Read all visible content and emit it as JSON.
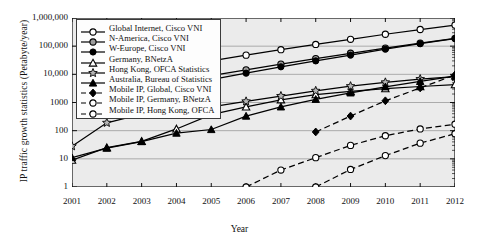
{
  "chart_data": {
    "type": "line",
    "title": "",
    "xlabel": "Year",
    "ylabel": "IP traffic growth statistics (Petabyte/year)",
    "x": [
      2001,
      2002,
      2003,
      2004,
      2005,
      2006,
      2007,
      2008,
      2009,
      2010,
      2011,
      2012
    ],
    "xtick_labels": [
      "2001",
      "2002",
      "2003",
      "2004",
      "2005",
      "2006",
      "2007",
      "2008",
      "2009",
      "2010",
      "2011",
      "2012"
    ],
    "ytick_labels": [
      "1,000,000",
      "100,000",
      "10,000",
      "1000",
      "100",
      "10",
      "1"
    ],
    "ytick_values": [
      1000000,
      100000,
      10000,
      1000,
      100,
      10,
      1
    ],
    "yscale": "log",
    "ylim": [
      1,
      1000000
    ],
    "xlim": [
      2001,
      2012
    ],
    "grid": "horizontal",
    "legend_position": "top-left inside",
    "plot_background": "#ebebeb",
    "series": [
      {
        "name": "Global Internet, Cisco VNI",
        "marker": "open-circle",
        "linestyle": "solid",
        "color": "#000000",
        "x": [
          2005,
          2006,
          2007,
          2008,
          2009,
          2010,
          2011,
          2012
        ],
        "values": [
          30000,
          48000,
          75000,
          115000,
          175000,
          265000,
          390000,
          560000
        ]
      },
      {
        "name": "N-America, Cisco VNI",
        "marker": "gray-circle",
        "linestyle": "solid",
        "color": "#000000",
        "x": [
          2005,
          2006,
          2007,
          2008,
          2009,
          2010,
          2011,
          2012
        ],
        "values": [
          9000,
          14500,
          23000,
          36000,
          56000,
          85000,
          128000,
          190000
        ]
      },
      {
        "name": "W-Europe, Cisco VNI",
        "marker": "filled-circle",
        "linestyle": "solid",
        "color": "#000000",
        "x": [
          2005,
          2006,
          2007,
          2008,
          2009,
          2010,
          2011,
          2012
        ],
        "values": [
          6500,
          11000,
          18500,
          30000,
          48000,
          78000,
          122000,
          185000
        ]
      },
      {
        "name": "Germany, BNetzA",
        "marker": "open-triangle",
        "linestyle": "solid",
        "color": "#000000",
        "x": [
          2001,
          2002,
          2003,
          2004,
          2005,
          2006,
          2007,
          2008,
          2009,
          2010,
          2011,
          2012
        ],
        "values": [
          9,
          25,
          42,
          115,
          370,
          700,
          1250,
          1900,
          2500,
          3100,
          3700,
          4300
        ]
      },
      {
        "name": "Hong Kong, OFCA Statistics",
        "marker": "gray-star",
        "linestyle": "solid",
        "color": "#000000",
        "x": [
          2001,
          2002,
          2003,
          2004,
          2005,
          2006,
          2007,
          2008,
          2009,
          2010,
          2011,
          2012
        ],
        "values": [
          28,
          190,
          390,
          480,
          700,
          1100,
          1700,
          2600,
          3800,
          5200,
          6800,
          8300
        ]
      },
      {
        "name": "Australia, Bureau of Statistics",
        "marker": "filled-triangle",
        "linestyle": "solid",
        "color": "#000000",
        "x": [
          2001,
          2002,
          2003,
          2004,
          2005,
          2006,
          2007,
          2008,
          2009,
          2010,
          2011,
          2012
        ],
        "values": [
          11,
          24,
          41,
          82,
          110,
          330,
          700,
          1300,
          2200,
          3600,
          5600,
          8600
        ]
      },
      {
        "name": "Mobile IP, Global, Cisco VNI",
        "marker": "filled-diamond",
        "linestyle": "dashed",
        "color": "#000000",
        "x": [
          2008,
          2009,
          2010,
          2011,
          2012
        ],
        "values": [
          90,
          330,
          1150,
          3300,
          9500
        ]
      },
      {
        "name": "Mobile IP, Germany, BNetzA",
        "marker": "open-circle",
        "linestyle": "dashed",
        "color": "#000000",
        "x": [
          2006,
          2007,
          2008,
          2009,
          2010,
          2011,
          2012
        ],
        "values": [
          1,
          4,
          11,
          30,
          66,
          115,
          170
        ]
      },
      {
        "name": "Mobile IP, Hong Kong, OFCA",
        "marker": "open-circle",
        "linestyle": "dashed",
        "color": "#000000",
        "x": [
          2008,
          2009,
          2010,
          2011,
          2012
        ],
        "values": [
          1,
          4.2,
          13,
          36,
          78
        ]
      }
    ]
  }
}
